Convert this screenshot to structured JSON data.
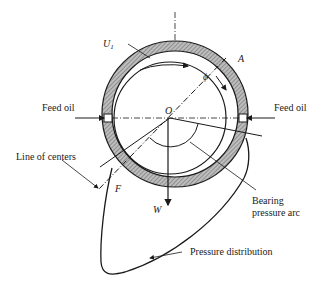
{
  "diagram": {
    "labels": {
      "velocity": "U",
      "velocity_sub": "1",
      "point_a": "A",
      "angle": "ϕ",
      "center": "O",
      "feed_oil_left": "Feed oil",
      "feed_oil_right": "Feed oil",
      "line_of_centers": "Line of centers",
      "point_f": "F",
      "load": "W",
      "bearing_arc_line1": "Bearing",
      "bearing_arc_line2": "pressure arc",
      "pressure_distribution": "Pressure distribution"
    },
    "colors": {
      "stroke": "#1a1a1a",
      "hatch": "#8a8a8a",
      "background": "#ffffff"
    }
  }
}
